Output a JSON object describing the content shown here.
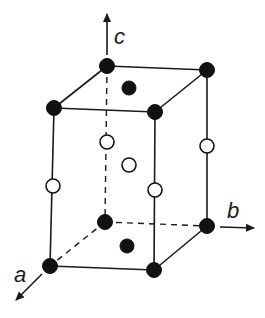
{
  "diagram": {
    "type": "crystal unit cell",
    "axes": [
      {
        "name": "c",
        "label": "c"
      },
      {
        "name": "b",
        "label": "b"
      },
      {
        "name": "a",
        "label": "a"
      }
    ],
    "atoms": {
      "filled_count": 10,
      "open_count": 5
    },
    "colors": {
      "line": "#1a1a1a",
      "filled_atom": "#111111",
      "open_atom_fill": "#ffffff"
    }
  }
}
